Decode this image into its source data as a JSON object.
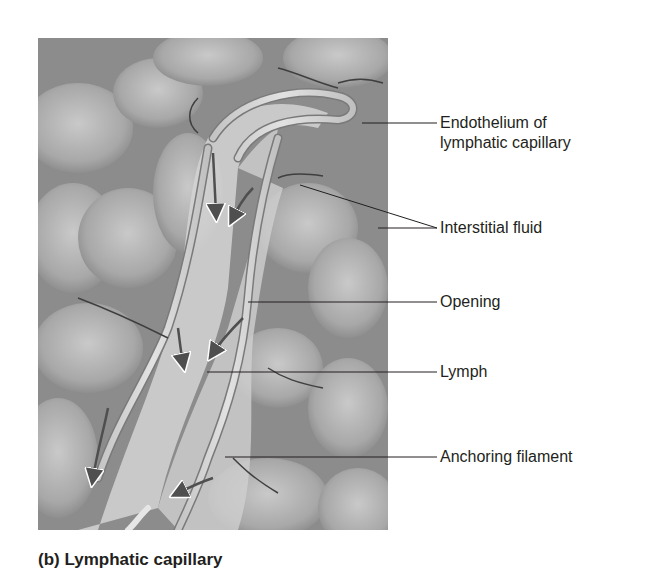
{
  "figure": {
    "title": "Lymphatic capillary",
    "panel": "(b)",
    "caption": "(b) Lymphatic capillary",
    "labels": [
      {
        "id": "endothelium",
        "line1": "Endothelium of",
        "line2": "lymphatic capillary"
      },
      {
        "id": "interstitial-fluid",
        "text": "Interstitial fluid"
      },
      {
        "id": "opening",
        "text": "Opening"
      },
      {
        "id": "lymph",
        "text": "Lymph"
      },
      {
        "id": "anchoring-filament",
        "text": "Anchoring filament"
      }
    ],
    "arrows_meaning": "flow of interstitial fluid into lymphatic capillary",
    "colors": {
      "tissue": "#8f8f8f",
      "cells": "#b5b5b5",
      "vessel": "#d9d9d9",
      "arrow": "#5a5a5a",
      "text": "#231f20"
    }
  }
}
